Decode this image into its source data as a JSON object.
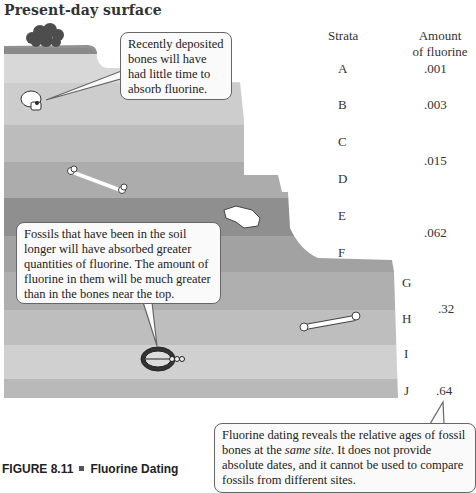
{
  "title": "Present-day surface",
  "table": {
    "strata_header": "Strata",
    "amount_header_line1": "Amount",
    "amount_header_line2": "of fluorine",
    "strata": [
      {
        "label": "A",
        "y": 70
      },
      {
        "label": "B",
        "y": 106
      },
      {
        "label": "C",
        "y": 143
      },
      {
        "label": "D",
        "y": 180
      },
      {
        "label": "E",
        "y": 217
      },
      {
        "label": "F",
        "y": 254
      },
      {
        "label": "G",
        "y": 284
      },
      {
        "label": "H",
        "y": 320
      },
      {
        "label": "I",
        "y": 355
      },
      {
        "label": "J",
        "y": 392
      }
    ],
    "amounts": [
      {
        "value": ".001",
        "y": 70,
        "spans": [
          "A"
        ]
      },
      {
        "value": ".003",
        "y": 106,
        "spans": [
          "B"
        ]
      },
      {
        "value": ".015",
        "y": 162,
        "spans": [
          "C",
          "D"
        ]
      },
      {
        "value": ".062",
        "y": 234,
        "spans": [
          "E",
          "F"
        ]
      },
      {
        "value": ".32",
        "y": 310,
        "spans": [
          "G",
          "H"
        ]
      },
      {
        "value": ".64",
        "y": 392,
        "spans": [
          "I",
          "J"
        ]
      }
    ]
  },
  "callouts": {
    "recent": "Recently deposited bones will have had little time to absorb fluorine.",
    "older": "Fossils that have been in the soil longer will have absorbed greater quantities of fluorine. The amount of fluorine in them will be much greater than in the bones near the top.",
    "dating_part1": "Fluorine dating reveals the relative ages of fossil bones at the ",
    "dating_italic": "same site",
    "dating_part2": ". It does not provide absolute dates, and it cannot be used to compare fossils from different sites."
  },
  "caption": {
    "figure": "FIGURE 8.11",
    "name": "Fluorine Dating"
  },
  "colors": {
    "band_A": "#d6d6d6",
    "band_B": "#cbcbcb",
    "band_C": "#b9b9b9",
    "band_D": "#a9a9a9",
    "band_E": "#8e8e8e",
    "band_F": "#a0a0a0",
    "band_G": "#adadad",
    "band_H": "#bdbdbd",
    "band_I": "#cfcfcf",
    "band_J": "#b8b8b8",
    "grass": "#6e6e6e",
    "bush": "#4a4a4a"
  }
}
